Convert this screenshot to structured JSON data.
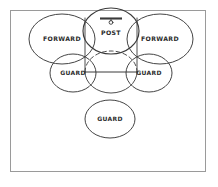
{
  "diagram": {
    "frame": {
      "border_color": "#9a9a9a",
      "background": "#ffffff"
    },
    "ink_color": "#3a3a3a",
    "court": {
      "lane_name": "free-throw-lane",
      "free_throw_line_label": "free-throw-line",
      "restraining_circle_label": "free-throw-circle",
      "dashed_arc_label": "lane-dashed-arc",
      "backboard_label": "backboard",
      "hoop_label": "hoop"
    },
    "positions": [
      {
        "id": "post",
        "label": "POST",
        "cx": 111,
        "cy": 31,
        "rx": 28,
        "ry": 23
      },
      {
        "id": "forward-left",
        "label": "FORWARD",
        "cx": 62,
        "cy": 39,
        "rx": 33,
        "ry": 25
      },
      {
        "id": "forward-right",
        "label": "FORWARD",
        "cx": 160,
        "cy": 39,
        "rx": 33,
        "ry": 25
      },
      {
        "id": "guard-left",
        "label": "GUARD",
        "cx": 73,
        "cy": 73,
        "rx": 23,
        "ry": 19
      },
      {
        "id": "guard-right",
        "label": "GUARD",
        "cx": 149,
        "cy": 73,
        "rx": 23,
        "ry": 19
      },
      {
        "id": "guard-bottom",
        "label": "GUARD",
        "cx": 110,
        "cy": 119,
        "rx": 25,
        "ry": 19
      }
    ]
  }
}
